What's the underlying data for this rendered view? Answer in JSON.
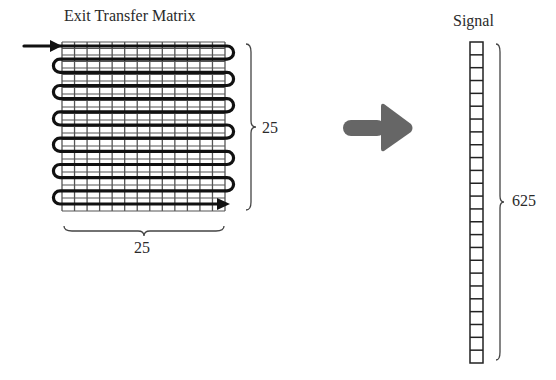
{
  "matrix": {
    "title": "Exit Transfer Matrix",
    "rows_label": "25",
    "cols_label": "25",
    "grid_columns_drawn": 13,
    "grid_rows_drawn": 26,
    "serpentine_passes": 13,
    "line_color": "#555555",
    "path_color": "#111111"
  },
  "transform_arrow": {
    "icon": "arrow-right-icon",
    "color": "#666666"
  },
  "signal": {
    "title": "Signal",
    "length_label": "625",
    "cells_drawn": 25,
    "cell_color": "#222222"
  }
}
